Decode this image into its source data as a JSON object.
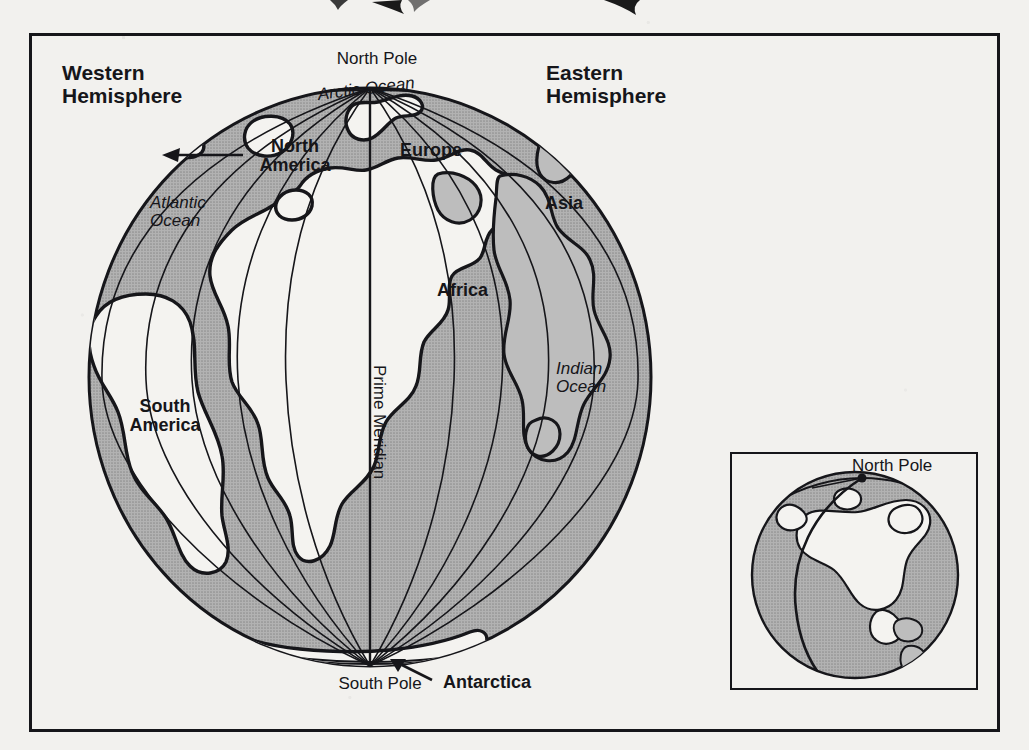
{
  "figure": {
    "type": "globe-diagram",
    "colors": {
      "paper": "#f2f1ee",
      "ink": "#16161a",
      "ocean_gray": "#a9a9a9",
      "land_white": "#f4f3f0",
      "shelf_gray": "#bdbdbd"
    }
  },
  "main_globe": {
    "hemispheres": [
      {
        "id": "western",
        "label": "Western\nHemisphere",
        "weight": "bold",
        "x": 140,
        "y": 68
      },
      {
        "id": "eastern",
        "label": "Eastern\nHemisphere",
        "weight": "bold",
        "x": 620,
        "y": 68
      }
    ],
    "poles": [
      {
        "id": "north-pole",
        "label": "North Pole",
        "weight": "regular",
        "x": 377,
        "y": 50
      },
      {
        "id": "south-pole",
        "label": "South Pole",
        "weight": "regular",
        "x": 322,
        "y": 675
      }
    ],
    "continents": [
      {
        "id": "north-america",
        "label": "North\nAmerica",
        "weight": "bold",
        "x": 243,
        "y": 136,
        "has_arrow": true
      },
      {
        "id": "europe",
        "label": "Europe",
        "weight": "bold",
        "x": 397,
        "y": 142,
        "has_arrow": false
      },
      {
        "id": "asia",
        "label": "Asia",
        "weight": "bold",
        "x": 542,
        "y": 194,
        "has_arrow": false
      },
      {
        "id": "africa",
        "label": "Africa",
        "weight": "bold",
        "x": 435,
        "y": 281,
        "has_arrow": false
      },
      {
        "id": "south-america",
        "label": "South\nAmerica",
        "weight": "bold",
        "x": 122,
        "y": 395,
        "has_arrow": false
      },
      {
        "id": "antarctica",
        "label": "Antarctica",
        "weight": "bold",
        "x": 440,
        "y": 675,
        "has_arrow": true
      }
    ],
    "oceans": [
      {
        "id": "arctic-ocean",
        "label": "Arctic Ocean",
        "style": "italic",
        "x": 318,
        "y": 88,
        "rotate": -8
      },
      {
        "id": "atlantic-ocean",
        "label": "Atlantic\nOcean",
        "style": "italic",
        "x": 150,
        "y": 193,
        "rotate": 0
      },
      {
        "id": "indian-ocean",
        "label": "Indian\nOcean",
        "style": "italic",
        "x": 558,
        "y": 359,
        "rotate": 0
      }
    ],
    "meridian": {
      "id": "prime-meridian",
      "label": "Prime Meridian",
      "style": "regular",
      "x": 381,
      "y": 363,
      "rotation_deg": 90
    },
    "geometry": {
      "cx": 370,
      "cy": 377,
      "rx": 281,
      "ry": 289,
      "meridian_count": 13,
      "graticule_step_deg": 15
    }
  },
  "inset_globe": {
    "label": {
      "id": "north-pole",
      "text": "North Pole",
      "weight": "regular",
      "x": 862,
      "y": 466
    },
    "subject": "North America",
    "geometry": {
      "cx": 855,
      "cy": 575,
      "r": 103
    }
  }
}
